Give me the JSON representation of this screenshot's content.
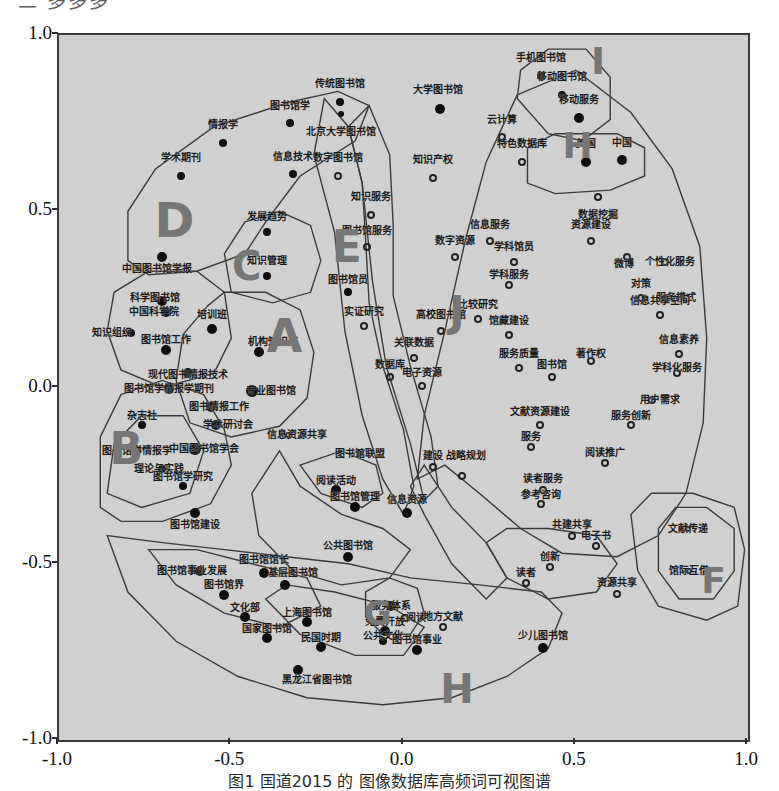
{
  "figure": {
    "top_clipped_text": "二 多多多",
    "caption": "图1  国道2015 的 图像数据库高频词可视图谱",
    "background_color": "#d0d0d0",
    "frame_color": "#3a3a3a"
  },
  "chart_data": {
    "type": "scatter",
    "title": "",
    "xlabel": "",
    "ylabel": "",
    "xlim": [
      -1.0,
      1.0
    ],
    "ylim": [
      -1.0,
      1.0
    ],
    "grid": false,
    "legend": "none",
    "xticks": [
      "-1.0",
      "-0.5",
      "0.0",
      "0.5",
      "1.0"
    ],
    "yticks": [
      "1.0",
      "0.5",
      "0.0",
      "-0.5",
      "-1.0"
    ],
    "cluster_letters": [
      {
        "label": "A",
        "x": -0.345,
        "y": 0.145,
        "size": 46
      },
      {
        "label": "B",
        "x": -0.805,
        "y": -0.175,
        "size": 44
      },
      {
        "label": "C",
        "x": -0.455,
        "y": 0.345,
        "size": 40
      },
      {
        "label": "D",
        "x": -0.665,
        "y": 0.475,
        "size": 48
      },
      {
        "label": "E",
        "x": -0.165,
        "y": 0.4,
        "size": 44
      },
      {
        "label": "F",
        "x": 0.9,
        "y": -0.55,
        "size": 36
      },
      {
        "label": "G",
        "x": -0.075,
        "y": -0.64,
        "size": 34
      },
      {
        "label": "H",
        "x": 0.155,
        "y": -0.855,
        "size": 40
      },
      {
        "label": "H",
        "x": 0.505,
        "y": 0.685,
        "size": 36
      },
      {
        "label": "I",
        "x": 0.565,
        "y": 0.925,
        "size": 38
      },
      {
        "label": "J",
        "x": 0.155,
        "y": 0.215,
        "size": 42
      }
    ],
    "points": [
      {
        "label": "传统图书馆",
        "x": -0.185,
        "y": 0.81,
        "filled": true,
        "r": 4,
        "lx": -0.185,
        "ly": 0.86
      },
      {
        "label": "大学图书馆",
        "x": 0.105,
        "y": 0.79,
        "filled": true,
        "r": 5,
        "lx": 0.1,
        "ly": 0.845
      },
      {
        "label": "图书馆学",
        "x": -0.33,
        "y": 0.75,
        "filled": true,
        "r": 4,
        "lx": -0.33,
        "ly": 0.8
      },
      {
        "label": "北京大学图书馆",
        "x": -0.18,
        "y": 0.775,
        "filled": true,
        "r": 3,
        "lx": -0.18,
        "ly": 0.725
      },
      {
        "label": "情报学",
        "x": -0.525,
        "y": 0.695,
        "filled": true,
        "r": 4,
        "lx": -0.525,
        "ly": 0.745
      },
      {
        "label": "云计算",
        "x": 0.285,
        "y": 0.71,
        "filled": false,
        "r": 4,
        "lx": 0.285,
        "ly": 0.76
      },
      {
        "label": "信息技术",
        "x": -0.32,
        "y": 0.605,
        "filled": true,
        "r": 4,
        "lx": -0.32,
        "ly": 0.655
      },
      {
        "label": "学术期刊",
        "x": -0.645,
        "y": 0.6,
        "filled": true,
        "r": 4,
        "lx": -0.645,
        "ly": 0.65
      },
      {
        "label": "数字图书馆",
        "x": -0.19,
        "y": 0.6,
        "filled": false,
        "r": 4,
        "lx": -0.19,
        "ly": 0.65
      },
      {
        "label": "知识产权",
        "x": 0.085,
        "y": 0.595,
        "filled": false,
        "r": 4,
        "lx": 0.085,
        "ly": 0.645
      },
      {
        "label": "特色数据库",
        "x": 0.345,
        "y": 0.64,
        "filled": false,
        "r": 4,
        "lx": 0.345,
        "ly": 0.69
      },
      {
        "label": "手机图书馆",
        "x": 0.4,
        "y": 0.885,
        "filled": true,
        "r": 4,
        "lx": 0.4,
        "ly": 0.935
      },
      {
        "label": "移动图书馆",
        "x": 0.46,
        "y": 0.83,
        "filled": true,
        "r": 4,
        "lx": 0.46,
        "ly": 0.88
      },
      {
        "label": "移动服务",
        "x": 0.51,
        "y": 0.765,
        "filled": true,
        "r": 5,
        "lx": 0.51,
        "ly": 0.815
      },
      {
        "label": "美国",
        "x": 0.53,
        "y": 0.64,
        "filled": true,
        "r": 5,
        "lx": 0.53,
        "ly": 0.69
      },
      {
        "label": "中国",
        "x": 0.635,
        "y": 0.645,
        "filled": true,
        "r": 5,
        "lx": 0.635,
        "ly": 0.695
      },
      {
        "label": "数据挖掘",
        "x": 0.565,
        "y": 0.54,
        "filled": false,
        "r": 4,
        "lx": 0.565,
        "ly": 0.49
      },
      {
        "label": "知识服务",
        "x": -0.095,
        "y": 0.49,
        "filled": false,
        "r": 4,
        "lx": -0.095,
        "ly": 0.54
      },
      {
        "label": "发展趋势",
        "x": -0.395,
        "y": 0.44,
        "filled": true,
        "r": 4,
        "lx": -0.395,
        "ly": 0.485
      },
      {
        "label": "图书馆服务",
        "x": -0.105,
        "y": 0.4,
        "filled": false,
        "r": 4,
        "lx": -0.105,
        "ly": 0.445
      },
      {
        "label": "信息服务",
        "x": 0.25,
        "y": 0.415,
        "filled": false,
        "r": 4,
        "lx": 0.25,
        "ly": 0.46
      },
      {
        "label": "资源建设",
        "x": 0.545,
        "y": 0.415,
        "filled": false,
        "r": 4,
        "lx": 0.545,
        "ly": 0.46
      },
      {
        "label": "数字资源",
        "x": 0.15,
        "y": 0.37,
        "filled": false,
        "r": 4,
        "lx": 0.15,
        "ly": 0.415
      },
      {
        "label": "学科馆员",
        "x": 0.32,
        "y": 0.355,
        "filled": false,
        "r": 4,
        "lx": 0.32,
        "ly": 0.4
      },
      {
        "label": "微博",
        "x": 0.65,
        "y": 0.37,
        "filled": false,
        "r": 4,
        "lx": 0.64,
        "ly": 0.35
      },
      {
        "label": "个性化服务",
        "x": 0.76,
        "y": 0.355,
        "filled": false,
        "r": 4,
        "lx": 0.775,
        "ly": 0.355
      },
      {
        "label": "中国图书馆学报",
        "x": -0.7,
        "y": 0.37,
        "filled": true,
        "r": 5,
        "lx": -0.715,
        "ly": 0.335
      },
      {
        "label": "知识管理",
        "x": -0.395,
        "y": 0.315,
        "filled": true,
        "r": 4,
        "lx": -0.395,
        "ly": 0.36
      },
      {
        "label": "学科服务",
        "x": 0.305,
        "y": 0.29,
        "filled": false,
        "r": 4,
        "lx": 0.305,
        "ly": 0.32
      },
      {
        "label": "图书馆员",
        "x": -0.16,
        "y": 0.27,
        "filled": true,
        "r": 4,
        "lx": -0.16,
        "ly": 0.305
      },
      {
        "label": "对策",
        "x": 0.69,
        "y": 0.255,
        "filled": false,
        "r": 4,
        "lx": 0.69,
        "ly": 0.295
      },
      {
        "label": "服务模式",
        "x": 0.76,
        "y": 0.255,
        "filled": false,
        "r": 4,
        "lx": 0.79,
        "ly": 0.255
      },
      {
        "label": "信息共享空间",
        "x": 0.745,
        "y": 0.205,
        "filled": false,
        "r": 4,
        "lx": 0.745,
        "ly": 0.245
      },
      {
        "label": "科学图书馆",
        "x": -0.7,
        "y": 0.245,
        "filled": true,
        "r": 5,
        "lx": -0.72,
        "ly": 0.255
      },
      {
        "label": "中国科学院",
        "x": -0.69,
        "y": 0.215,
        "filled": true,
        "r": 5,
        "lx": -0.725,
        "ly": 0.215
      },
      {
        "label": "实证研究",
        "x": -0.115,
        "y": 0.175,
        "filled": false,
        "r": 4,
        "lx": -0.115,
        "ly": 0.215
      },
      {
        "label": "高校图书馆",
        "x": 0.11,
        "y": 0.16,
        "filled": false,
        "r": 4,
        "lx": 0.11,
        "ly": 0.205
      },
      {
        "label": "比较研究",
        "x": 0.215,
        "y": 0.195,
        "filled": false,
        "r": 4,
        "lx": 0.215,
        "ly": 0.235
      },
      {
        "label": "馆藏建设",
        "x": 0.305,
        "y": 0.15,
        "filled": false,
        "r": 4,
        "lx": 0.305,
        "ly": 0.19
      },
      {
        "label": "培训班",
        "x": -0.555,
        "y": 0.165,
        "filled": true,
        "r": 5,
        "lx": -0.555,
        "ly": 0.205
      },
      {
        "label": "知识组织",
        "x": -0.79,
        "y": 0.155,
        "filled": true,
        "r": 4,
        "lx": -0.845,
        "ly": 0.155
      },
      {
        "label": "图书馆工作",
        "x": -0.69,
        "y": 0.105,
        "filled": true,
        "r": 5,
        "lx": -0.69,
        "ly": 0.135
      },
      {
        "label": "机构知识库",
        "x": -0.42,
        "y": 0.1,
        "filled": true,
        "r": 5,
        "lx": -0.38,
        "ly": 0.13
      },
      {
        "label": "关联数据",
        "x": 0.03,
        "y": 0.085,
        "filled": false,
        "r": 4,
        "lx": 0.03,
        "ly": 0.125
      },
      {
        "label": "信息素养",
        "x": 0.8,
        "y": 0.095,
        "filled": false,
        "r": 4,
        "lx": 0.8,
        "ly": 0.135
      },
      {
        "label": "服务质量",
        "x": 0.335,
        "y": 0.055,
        "filled": false,
        "r": 4,
        "lx": 0.335,
        "ly": 0.095
      },
      {
        "label": "著作权",
        "x": 0.545,
        "y": 0.075,
        "filled": false,
        "r": 4,
        "lx": 0.545,
        "ly": 0.095
      },
      {
        "label": "数据库",
        "x": -0.04,
        "y": 0.03,
        "filled": false,
        "r": 4,
        "lx": -0.04,
        "ly": 0.065
      },
      {
        "label": "图书馆",
        "x": 0.43,
        "y": 0.03,
        "filled": false,
        "r": 4,
        "lx": 0.43,
        "ly": 0.065
      },
      {
        "label": "学科化服务",
        "x": 0.795,
        "y": 0.04,
        "filled": false,
        "r": 4,
        "lx": 0.795,
        "ly": 0.055
      },
      {
        "label": "电子资源",
        "x": 0.055,
        "y": 0.005,
        "filled": false,
        "r": 4,
        "lx": 0.055,
        "ly": 0.04
      },
      {
        "label": "现代图书情报技术",
        "x": -0.625,
        "y": 0.04,
        "filled": true,
        "r": 5,
        "lx": -0.625,
        "ly": 0.035
      },
      {
        "label": "图书馆学情报学期刊",
        "x": -0.68,
        "y": -0.005,
        "filled": true,
        "r": 5,
        "lx": -0.68,
        "ly": -0.005
      },
      {
        "label": "专业图书馆",
        "x": -0.44,
        "y": -0.01,
        "filled": true,
        "r": 6,
        "lx": -0.385,
        "ly": -0.01
      },
      {
        "label": "图书情报工作",
        "x": -0.56,
        "y": -0.055,
        "filled": true,
        "r": 5,
        "lx": -0.535,
        "ly": -0.055
      },
      {
        "label": "用户需求",
        "x": 0.72,
        "y": -0.035,
        "filled": false,
        "r": 4,
        "lx": 0.745,
        "ly": -0.035
      },
      {
        "label": "杂志社",
        "x": -0.76,
        "y": -0.105,
        "filled": true,
        "r": 4,
        "lx": -0.76,
        "ly": -0.08
      },
      {
        "label": "学术研讨会",
        "x": -0.545,
        "y": -0.105,
        "filled": true,
        "r": 5,
        "lx": -0.51,
        "ly": -0.105
      },
      {
        "label": "信息资源共享",
        "x": -0.335,
        "y": -0.135,
        "filled": false,
        "r": 3,
        "lx": -0.31,
        "ly": -0.135
      },
      {
        "label": "文献资源建设",
        "x": 0.395,
        "y": -0.105,
        "filled": false,
        "r": 4,
        "lx": 0.395,
        "ly": -0.07
      },
      {
        "label": "服务创新",
        "x": 0.66,
        "y": -0.105,
        "filled": false,
        "r": 4,
        "lx": 0.66,
        "ly": -0.08
      },
      {
        "label": "图书馆学情报学",
        "x": -0.775,
        "y": -0.18,
        "filled": true,
        "r": 4,
        "lx": -0.775,
        "ly": -0.18
      },
      {
        "label": "中国图书馆学会",
        "x": -0.605,
        "y": -0.175,
        "filled": true,
        "r": 6,
        "lx": -0.58,
        "ly": -0.175
      },
      {
        "label": "服务",
        "x": 0.37,
        "y": -0.17,
        "filled": false,
        "r": 4,
        "lx": 0.37,
        "ly": -0.14
      },
      {
        "label": "图书馆联盟",
        "x": -0.125,
        "y": -0.19,
        "filled": false,
        "r": 3,
        "lx": -0.125,
        "ly": -0.19
      },
      {
        "label": "理论与实践",
        "x": -0.7,
        "y": -0.23,
        "filled": true,
        "r": 4,
        "lx": -0.71,
        "ly": -0.23
      },
      {
        "label": "阅读推广",
        "x": 0.585,
        "y": -0.215,
        "filled": false,
        "r": 4,
        "lx": 0.585,
        "ly": -0.185
      },
      {
        "label": "建设",
        "x": 0.085,
        "y": -0.225,
        "filled": false,
        "r": 4,
        "lx": 0.085,
        "ly": -0.195
      },
      {
        "label": "战略规划",
        "x": 0.17,
        "y": -0.25,
        "filled": false,
        "r": 4,
        "lx": 0.18,
        "ly": -0.195
      },
      {
        "label": "图书馆学研究",
        "x": -0.64,
        "y": -0.28,
        "filled": true,
        "r": 4,
        "lx": -0.64,
        "ly": -0.255
      },
      {
        "label": "阅读活动",
        "x": -0.195,
        "y": -0.29,
        "filled": true,
        "r": 5,
        "lx": -0.195,
        "ly": -0.265
      },
      {
        "label": "读者服务",
        "x": 0.405,
        "y": -0.29,
        "filled": false,
        "r": 4,
        "lx": 0.405,
        "ly": -0.26
      },
      {
        "label": "图书馆管理",
        "x": -0.14,
        "y": -0.34,
        "filled": true,
        "r": 5,
        "lx": -0.14,
        "ly": -0.31
      },
      {
        "label": "信息资源",
        "x": 0.01,
        "y": -0.355,
        "filled": true,
        "r": 5,
        "lx": 0.01,
        "ly": -0.32
      },
      {
        "label": "参考咨询",
        "x": 0.4,
        "y": -0.33,
        "filled": false,
        "r": 4,
        "lx": 0.4,
        "ly": -0.305
      },
      {
        "label": "图书馆建设",
        "x": -0.605,
        "y": -0.355,
        "filled": true,
        "r": 5,
        "lx": -0.605,
        "ly": -0.39
      },
      {
        "label": "文献传递",
        "x": 0.825,
        "y": -0.4,
        "filled": false,
        "r": 3,
        "lx": 0.825,
        "ly": -0.4
      },
      {
        "label": "共建共享",
        "x": 0.49,
        "y": -0.42,
        "filled": false,
        "r": 4,
        "lx": 0.49,
        "ly": -0.39
      },
      {
        "label": "电子书",
        "x": 0.56,
        "y": -0.45,
        "filled": false,
        "r": 4,
        "lx": 0.56,
        "ly": -0.42
      },
      {
        "label": "公共图书馆",
        "x": -0.16,
        "y": -0.48,
        "filled": true,
        "r": 5,
        "lx": -0.16,
        "ly": -0.45
      },
      {
        "label": "创新",
        "x": 0.425,
        "y": -0.51,
        "filled": false,
        "r": 4,
        "lx": 0.425,
        "ly": -0.48
      },
      {
        "label": "馆际互借",
        "x": 0.83,
        "y": -0.52,
        "filled": false,
        "r": 3,
        "lx": 0.83,
        "ly": -0.52
      },
      {
        "label": "图书馆馆长",
        "x": -0.405,
        "y": -0.525,
        "filled": true,
        "r": 5,
        "lx": -0.405,
        "ly": -0.49
      },
      {
        "label": "图书馆事业发展",
        "x": -0.59,
        "y": -0.52,
        "filled": true,
        "r": 5,
        "lx": -0.615,
        "ly": -0.52
      },
      {
        "label": "基层图书馆",
        "x": -0.345,
        "y": -0.56,
        "filled": true,
        "r": 5,
        "lx": -0.32,
        "ly": -0.525
      },
      {
        "label": "读者",
        "x": 0.355,
        "y": -0.555,
        "filled": false,
        "r": 4,
        "lx": 0.355,
        "ly": -0.525
      },
      {
        "label": "资源共享",
        "x": 0.62,
        "y": -0.585,
        "filled": false,
        "r": 4,
        "lx": 0.62,
        "ly": -0.555
      },
      {
        "label": "图书馆界",
        "x": -0.52,
        "y": -0.59,
        "filled": true,
        "r": 5,
        "lx": -0.52,
        "ly": -0.56
      },
      {
        "label": "服务体系",
        "x": -0.035,
        "y": -0.62,
        "filled": true,
        "r": 5,
        "lx": -0.035,
        "ly": -0.62
      },
      {
        "label": "文化部",
        "x": -0.46,
        "y": -0.65,
        "filled": true,
        "r": 5,
        "lx": -0.46,
        "ly": -0.625
      },
      {
        "label": "上海图书馆",
        "x": -0.28,
        "y": -0.665,
        "filled": true,
        "r": 5,
        "lx": -0.28,
        "ly": -0.64
      },
      {
        "label": "阅读",
        "x": 0.005,
        "y": -0.655,
        "filled": false,
        "r": 4,
        "lx": 0.035,
        "ly": -0.655
      },
      {
        "label": "地方文献",
        "x": 0.115,
        "y": -0.68,
        "filled": false,
        "r": 4,
        "lx": 0.115,
        "ly": -0.65
      },
      {
        "label": "国家图书馆",
        "x": -0.395,
        "y": -0.71,
        "filled": true,
        "r": 5,
        "lx": -0.395,
        "ly": -0.685
      },
      {
        "label": "免费开放",
        "x": -0.055,
        "y": -0.69,
        "filled": true,
        "r": 5,
        "lx": -0.055,
        "ly": -0.665
      },
      {
        "label": "民国时期",
        "x": -0.24,
        "y": -0.735,
        "filled": true,
        "r": 5,
        "lx": -0.24,
        "ly": -0.71
      },
      {
        "label": "公共文化",
        "x": -0.06,
        "y": -0.72,
        "filled": true,
        "r": 4,
        "lx": -0.06,
        "ly": -0.705
      },
      {
        "label": "图书馆事业",
        "x": 0.04,
        "y": -0.745,
        "filled": true,
        "r": 5,
        "lx": 0.04,
        "ly": -0.715
      },
      {
        "label": "少儿图书馆",
        "x": 0.405,
        "y": -0.74,
        "filled": true,
        "r": 5,
        "lx": 0.405,
        "ly": -0.705
      },
      {
        "label": "黑龙江省图书馆",
        "x": -0.305,
        "y": -0.8,
        "filled": true,
        "r": 5,
        "lx": -0.25,
        "ly": -0.83
      }
    ]
  }
}
